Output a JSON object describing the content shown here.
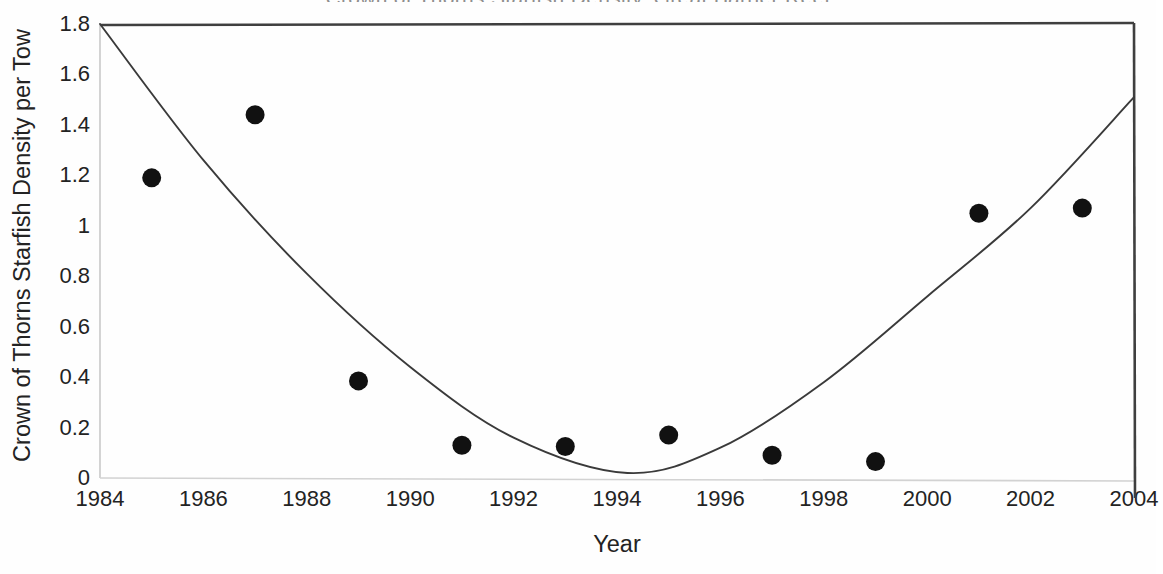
{
  "figure": {
    "title_remnant": "Crown of Thorns Starfish Density, Great Barrier Reef",
    "background_color": "#ffffff",
    "marker_color": "#111111",
    "line_color": "#3a3a3a",
    "axis_color": "#3f3f3f"
  },
  "chart_data": {
    "type": "scatter",
    "title": "",
    "xlabel": "Year",
    "ylabel": "Crown of Thorns Starfish Density per Tow",
    "xlim": [
      1984,
      2004
    ],
    "ylim": [
      0,
      1.8
    ],
    "grid": false,
    "legend": "none",
    "xticks": [
      1984,
      1986,
      1988,
      1990,
      1992,
      1994,
      1996,
      1998,
      2000,
      2002,
      2004
    ],
    "xtick_labels": [
      "1984",
      "1986",
      "1988",
      "1990",
      "1992",
      "1994",
      "1996",
      "1998",
      "2000",
      "2002",
      "2004"
    ],
    "yticks": [
      0,
      0.2,
      0.4,
      0.6,
      0.8,
      1,
      1.2,
      1.4,
      1.6,
      1.8
    ],
    "ytick_labels": [
      "0",
      "0.2",
      "0.4",
      "0.6",
      "0.8",
      "1",
      "1.2",
      "1.4",
      "1.6",
      "1.8"
    ],
    "series": [
      {
        "name": "Observed density",
        "type": "scatter",
        "marker": "filled-circle",
        "x": [
          1985,
          1987,
          1989,
          1991,
          1993,
          1995,
          1997,
          1999,
          2001,
          2003
        ],
        "y": [
          1.19,
          1.44,
          0.385,
          0.13,
          0.125,
          0.17,
          0.09,
          0.065,
          1.05,
          1.07
        ]
      },
      {
        "name": "Fitted quadratic trend",
        "type": "line",
        "x": [
          1984,
          1986,
          1988,
          1990,
          1992,
          1994.2,
          1996,
          1998,
          2000,
          2002,
          2004
        ],
        "y": [
          1.8,
          1.26,
          0.81,
          0.44,
          0.16,
          0.02,
          0.12,
          0.38,
          0.72,
          1.07,
          1.51
        ]
      }
    ]
  }
}
